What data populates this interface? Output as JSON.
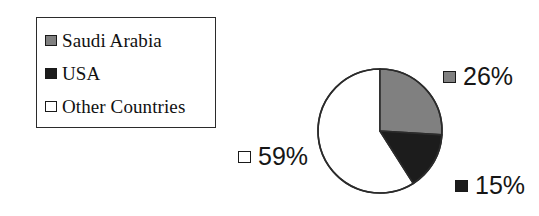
{
  "chart_data": {
    "type": "pie",
    "title": "",
    "categories": [
      "Saudi Arabia",
      "USA",
      "Other Countries"
    ],
    "values": [
      26,
      15,
      59
    ],
    "value_labels": [
      "26%",
      "15%",
      "59%"
    ],
    "units": "percent",
    "total": 100,
    "start_angle_deg": 0,
    "direction": "clockwise",
    "legend": {
      "position": "top-left",
      "bordered": true,
      "entries": [
        {
          "label": "Saudi Arabia",
          "swatch": "gray-swatch",
          "color": "#808080"
        },
        {
          "label": "USA",
          "swatch": "black-swatch",
          "color": "#1c1c1c"
        },
        {
          "label": "Other Countries",
          "swatch": "white-swatch",
          "color": "#ffffff"
        }
      ]
    },
    "slices": [
      {
        "name": "Saudi Arabia",
        "value": 26,
        "label": "26%",
        "color": "#808080",
        "start_deg": 0,
        "end_deg": 93.6,
        "label_position": "right-top"
      },
      {
        "name": "USA",
        "value": 15,
        "label": "15%",
        "color": "#1c1c1c",
        "start_deg": 93.6,
        "end_deg": 147.6,
        "label_position": "right-bottom"
      },
      {
        "name": "Other Countries",
        "value": 59,
        "label": "59%",
        "color": "#ffffff",
        "start_deg": 147.6,
        "end_deg": 360,
        "label_position": "left"
      }
    ],
    "geometry": {
      "center_x": 380,
      "center_y": 131,
      "radius": 62
    },
    "style": {
      "outline_color": "#2b2b2b",
      "background": "#ffffff",
      "grid": false
    },
    "xlabel": "",
    "ylabel": ""
  }
}
